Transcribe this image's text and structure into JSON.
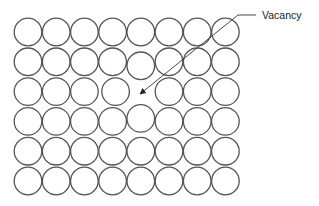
{
  "diagram": {
    "title": "",
    "lattice": {
      "columns": 8,
      "rows": 6,
      "radius": 13.8,
      "origin_x": 28,
      "origin_y": 32,
      "pitch_x": 28.2,
      "pitch_y": 29.8,
      "vacancy": {
        "row": 2,
        "col": 4
      },
      "displaced": [
        {
          "row": 1,
          "col": 4,
          "dx": 0,
          "dy": 4
        },
        {
          "row": 2,
          "col": 3,
          "dx": 3,
          "dy": 0
        },
        {
          "row": 3,
          "col": 4,
          "dx": 0,
          "dy": -3
        }
      ]
    },
    "annotation": {
      "label": "Vacancy",
      "label_x": 262,
      "label_y": 19,
      "leader_points": [
        [
          256,
          15
        ],
        [
          238,
          15
        ],
        [
          140,
          94
        ]
      ]
    },
    "colors": {
      "stroke": "#555555",
      "text": "#222222",
      "background": "#ffffff"
    }
  }
}
